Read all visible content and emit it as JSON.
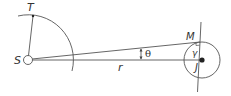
{
  "diagram": {
    "type": "geometry-orbit-figure",
    "labels": {
      "S": "S",
      "T": "T",
      "M": "M",
      "J": "J",
      "r": "r",
      "theta": "θ",
      "gamma": "γ"
    },
    "colors": {
      "stroke": "#555555",
      "text": "#333333",
      "point": "#222222",
      "background": "#ffffff"
    }
  }
}
